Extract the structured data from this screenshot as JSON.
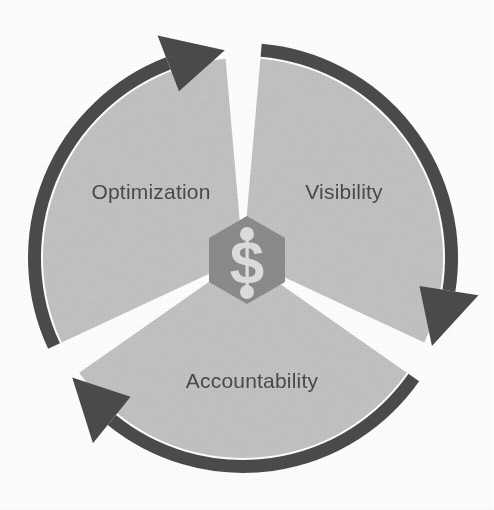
{
  "diagram": {
    "type": "three-stage-cyclical-process",
    "title": "",
    "direction": "clockwise",
    "center": {
      "icon_name": "dollar-sign-hexagon-icon",
      "glyph": "$",
      "shape": "hexagon",
      "shape_color": "#8c8c8c",
      "glyph_color": "#dedede"
    },
    "colors": {
      "segment_fill": "#c6c6c6",
      "ring_arrow": "#4d4d4d",
      "label_text": "#4a4a4a",
      "background": "#ffffff",
      "gap": "#ffffff"
    },
    "geometry": {
      "center_x": 243,
      "center_y": 258,
      "outer_radius": 215,
      "ring_thickness": 13,
      "gap_degrees": 5,
      "segment_count": 3
    },
    "segments": [
      {
        "id": "visibility",
        "label": "Visibility",
        "order": 1,
        "start_deg": -85,
        "end_deg": 25,
        "label_x": 344,
        "label_y": 193
      },
      {
        "id": "accountability",
        "label": "Accountability",
        "order": 2,
        "start_deg": 35,
        "end_deg": 145,
        "label_x": 252,
        "label_y": 382
      },
      {
        "id": "optimization",
        "label": "Optimization",
        "order": 3,
        "start_deg": 155,
        "end_deg": 265,
        "label_x": 151,
        "label_y": 193
      }
    ],
    "arrows": [
      {
        "id": "arrow-top",
        "points_to": "visibility",
        "tip_deg": -86,
        "direction": "clockwise"
      },
      {
        "id": "arrow-right",
        "points_to": "accountability",
        "tip_deg": 34,
        "direction": "clockwise"
      },
      {
        "id": "arrow-bottom-left",
        "points_to": "optimization",
        "tip_deg": 154,
        "direction": "clockwise"
      }
    ]
  }
}
